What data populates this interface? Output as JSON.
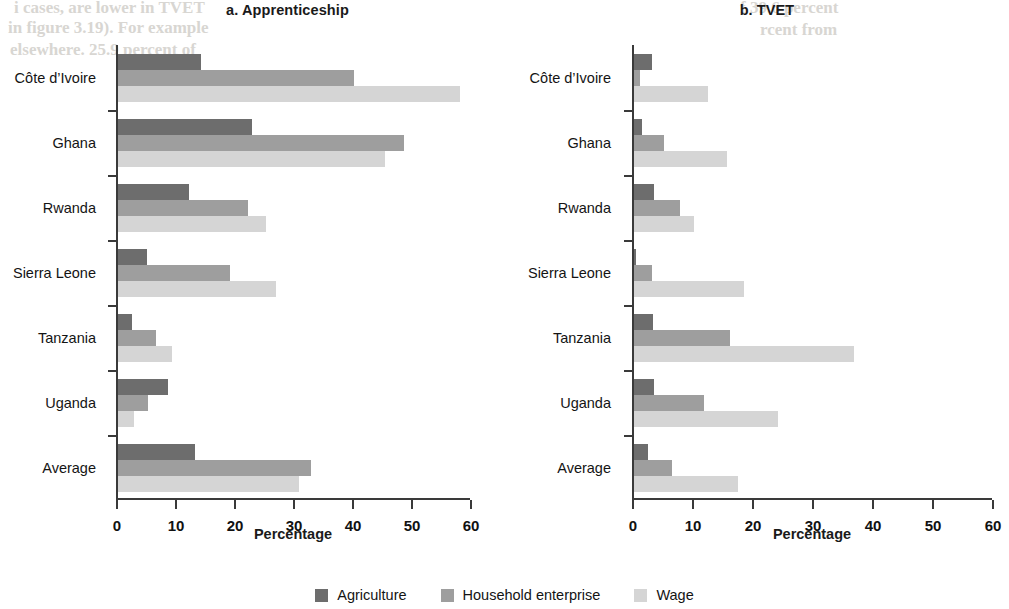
{
  "figure": {
    "legend": [
      {
        "label": "Agriculture",
        "color": "#6d6d6d",
        "key": "agriculture"
      },
      {
        "label": "Household enterprise",
        "color": "#9e9e9e",
        "key": "household"
      },
      {
        "label": "Wage",
        "color": "#d5d5d5",
        "key": "wage"
      }
    ]
  },
  "chart_data": [
    {
      "type": "bar",
      "orientation": "horizontal",
      "title": "a. Apprenticeship",
      "panel_letter": "a.",
      "panel_name": "Apprenticeship",
      "xlabel": "Percentage",
      "ylabel": "",
      "xlim": [
        0,
        60
      ],
      "xticks": [
        0,
        10,
        20,
        30,
        40,
        50,
        60
      ],
      "xtick_labels": [
        "0",
        "10",
        "20",
        "30",
        "40",
        "50",
        "60"
      ],
      "grid": false,
      "legend_position": "bottom-center-shared",
      "categories": [
        "Côte d’Ivoire",
        "Ghana",
        "Rwanda",
        "Sierra Leone",
        "Tanzania",
        "Uganda",
        "Average"
      ],
      "series": [
        {
          "name": "Agriculture",
          "color": "#6d6d6d",
          "values": [
            14.1,
            22.7,
            12.0,
            4.9,
            2.3,
            8.5,
            13.1
          ]
        },
        {
          "name": "Household enterprise",
          "color": "#9e9e9e",
          "values": [
            40.0,
            48.4,
            22.0,
            19.0,
            6.5,
            5.1,
            32.7
          ]
        },
        {
          "name": "Wage",
          "color": "#d5d5d5",
          "values": [
            57.9,
            45.3,
            25.1,
            26.8,
            9.2,
            2.7,
            30.7
          ]
        }
      ]
    },
    {
      "type": "bar",
      "orientation": "horizontal",
      "title": "b. TVET",
      "panel_letter": "b.",
      "panel_name": "TVET",
      "xlabel": "Percentage",
      "ylabel": "",
      "xlim": [
        0,
        60
      ],
      "xticks": [
        0,
        10,
        20,
        30,
        40,
        50,
        60
      ],
      "xtick_labels": [
        "0",
        "10",
        "20",
        "30",
        "40",
        "50",
        "60"
      ],
      "grid": false,
      "legend_position": "bottom-center-shared",
      "categories": [
        "Côte d’Ivoire",
        "Ghana",
        "Rwanda",
        "Sierra Leone",
        "Tanzania",
        "Uganda",
        "Average"
      ],
      "series": [
        {
          "name": "Agriculture",
          "color": "#6d6d6d",
          "values": [
            3.0,
            1.3,
            3.4,
            0.4,
            3.2,
            3.3,
            2.3
          ]
        },
        {
          "name": "Household enterprise",
          "color": "#9e9e9e",
          "values": [
            1.0,
            5.0,
            7.6,
            3.0,
            16.0,
            11.7,
            6.3
          ]
        },
        {
          "name": "Wage",
          "color": "#d5d5d5",
          "values": [
            12.4,
            15.5,
            10.0,
            18.3,
            36.7,
            24.0,
            17.4
          ]
        }
      ]
    }
  ],
  "scan_artifacts": [
    {
      "text": "i cases, are lower in TVET",
      "x": 14,
      "y": -2,
      "size": 17
    },
    {
      "text": "in figure 3.19). For example",
      "x": 8,
      "y": 18,
      "size": 17
    },
    {
      "text": "elsewhere. 25.9 percent of",
      "x": 10,
      "y": 40,
      "size": 17
    },
    {
      "text": "f 39.6 percent",
      "x": 740,
      "y": -2,
      "size": 17
    },
    {
      "text": "rcent from",
      "x": 760,
      "y": 20,
      "size": 17
    }
  ]
}
